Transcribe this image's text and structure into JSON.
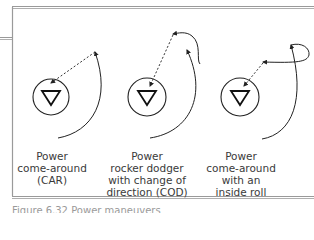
{
  "diagram": {
    "title": "Power maneuvers",
    "colors": {
      "stroke": "#333333",
      "frame": "#9a9a9a",
      "text": "#3a3a3a"
    },
    "maneuvers": [
      {
        "id": "car",
        "label_lines": [
          "Power",
          "come-around",
          "(CAR)"
        ],
        "icon": "down-triangle-in-circle"
      },
      {
        "id": "cod",
        "label_lines": [
          "Power",
          "rocker dodger",
          "with change of",
          "direction (COD)"
        ],
        "icon": "down-triangle-in-circle"
      },
      {
        "id": "roll",
        "label_lines": [
          "Power",
          "come-around",
          "with an",
          "inside roll"
        ],
        "icon": "down-triangle-in-circle"
      }
    ],
    "caption": "Figure 6.32 Power maneuvers"
  }
}
